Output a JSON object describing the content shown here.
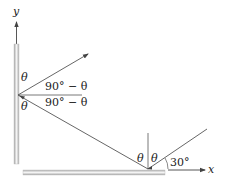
{
  "diagram": {
    "axes": {
      "y_label": "y",
      "x_label": "x"
    },
    "labels": {
      "theta_upper_left": "θ",
      "theta_lower_left": "θ",
      "complement_upper": "90° − θ",
      "complement_lower": "90° − θ",
      "theta_bottom_left": "θ",
      "theta_bottom_right": "θ",
      "angle_30": "30°"
    },
    "colors": {
      "line": "#555555",
      "mirror_light": "#f2f2f2",
      "mirror_dark": "#a8a8a8",
      "text": "#222222"
    }
  }
}
